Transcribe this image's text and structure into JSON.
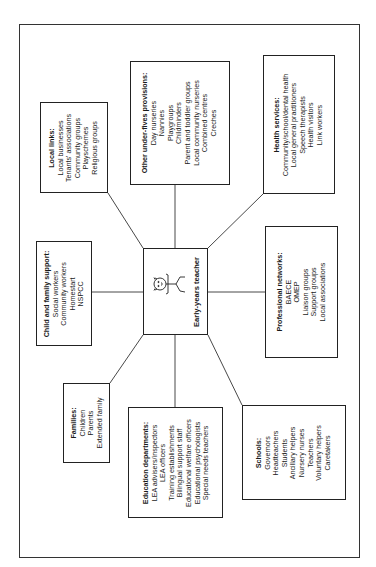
{
  "center": {
    "label": "Early-years teacher",
    "icon": "stick-figure-teacher-icon"
  },
  "boxes": {
    "local_links": {
      "title": "Local links:",
      "items": [
        "Local businesses",
        "Tenants' associations",
        "Community groups",
        "Playschemes",
        "Religious groups"
      ]
    },
    "under_fives": {
      "title": "Other under-fives provisions:",
      "items": [
        "Day nurseries",
        "Nannies",
        "Playgroups",
        "Childminders",
        "Parent and toddler groups",
        "Local community nurseries",
        "Combined centres",
        "Creches"
      ]
    },
    "health": {
      "title": "Health services:",
      "items": [
        "Community/school/dental health",
        "Local general practitioners",
        "Speech therapists",
        "Health visitors",
        "Link workers"
      ]
    },
    "child_family": {
      "title": "Child and family support:",
      "items": [
        "Social workers",
        "Community workers",
        "Homestart",
        "NSPCC"
      ]
    },
    "professional": {
      "title": "Professional networks:",
      "items": [
        "BAECE",
        "OMEP",
        "Liaison groups",
        "Support groups",
        "Local associations"
      ]
    },
    "families": {
      "title": "Families:",
      "items": [
        "Children",
        "Parents",
        "Extended family"
      ]
    },
    "education": {
      "title": "Education departments:",
      "items": [
        "LEA advisers/inspectors",
        "LEA officers",
        "Training establishments",
        "Bilingual support staff",
        "Educational welfare officers",
        "Educational psychologists",
        "Special needs teachers"
      ]
    },
    "schools": {
      "title": "Schools:",
      "items": [
        "Governors",
        "Headteachers",
        "Students",
        "Ancillary helpers",
        "Nursery nurses",
        "Teachers",
        "Voluntary helpers",
        "Caretakers"
      ]
    }
  },
  "colors": {
    "line": "#333333",
    "text": "#1a1a1a",
    "background": "#ffffff"
  }
}
